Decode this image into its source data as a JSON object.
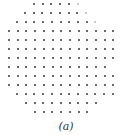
{
  "figure": {
    "caption": "(a)",
    "dot_color": "#555555",
    "faint_dot_color": "#bbbbbb",
    "spacing_x": 8.7,
    "rows": [
      {
        "y": 4,
        "start_x": 34,
        "count": 6,
        "faint_end": 1
      },
      {
        "y": 13,
        "start_x": 25,
        "count": 8,
        "faint_end": 1
      },
      {
        "y": 22,
        "start_x": 17,
        "count": 10,
        "faint_end": 1
      },
      {
        "y": 31,
        "start_x": 9,
        "count": 13,
        "faint_end": 0
      },
      {
        "y": 40,
        "start_x": 9,
        "count": 13,
        "faint_end": 0
      },
      {
        "y": 49,
        "start_x": 9,
        "count": 13,
        "faint_end": 0
      },
      {
        "y": 58,
        "start_x": 9,
        "count": 13,
        "faint_end": 0
      },
      {
        "y": 67,
        "start_x": 9,
        "count": 12,
        "faint_end": 0
      },
      {
        "y": 76,
        "start_x": 9,
        "count": 13,
        "faint_end": 0
      },
      {
        "y": 85,
        "start_x": 9,
        "count": 13,
        "faint_end": 0
      },
      {
        "y": 94,
        "start_x": 17,
        "count": 12,
        "faint_end": 0
      },
      {
        "y": 103,
        "start_x": 26,
        "count": 9,
        "faint_end": 0
      },
      {
        "y": 112,
        "start_x": 35,
        "count": 7,
        "faint_end": 0
      }
    ]
  }
}
